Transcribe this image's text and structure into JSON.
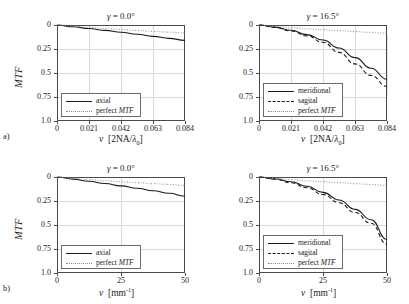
{
  "figure": {
    "panel_tags": [
      "a)",
      "b)"
    ],
    "ylabel": "MTF",
    "yticks": [
      "1.0",
      "0.75",
      "0.5",
      "0.25",
      "0"
    ],
    "xticks_top": [
      "0",
      "0.021",
      "0.042",
      "0.063",
      "0.084"
    ],
    "xticks_bottom": [
      "0",
      "25",
      "50"
    ],
    "xlabel_top_sym": "ν",
    "xlabel_top_unit_open": "[2NA/",
    "xlabel_top_unit_lambda": "λ",
    "xlabel_top_unit_sub": "0",
    "xlabel_top_unit_close": "]",
    "xlabel_bottom_sym": "ν",
    "xlabel_bottom_unit_open": "[mm",
    "xlabel_bottom_unit_sup": "-1",
    "xlabel_bottom_unit_close": "]",
    "title_gamma_sym": "γ",
    "title_axial": "= 0.0°",
    "title_tilt": "= 16.5°",
    "legend_axial": "axial",
    "legend_meridional": "meridional",
    "legend_sagital": "sagital",
    "legend_perfect_pre": "perfect ",
    "legend_perfect_mtf": "MTF",
    "colors": {
      "curve": "#1a1a1a",
      "perfect": "#9a9a9a",
      "grid": "#d8d8d8",
      "axis": "#4a4a4a"
    }
  },
  "chart_data": [
    {
      "type": "line",
      "panel": "a-left",
      "title": "γ = 0.0°",
      "xlabel": "ν [2NA/λ0]",
      "ylabel": "MTF",
      "xlim": [
        0,
        0.084
      ],
      "ylim": [
        0,
        1.0
      ],
      "xticks": [
        0,
        0.021,
        0.042,
        0.063,
        0.084
      ],
      "yticks": [
        0,
        0.25,
        0.5,
        0.75,
        1.0
      ],
      "grid": true,
      "legend_position": "lower-left",
      "series": [
        {
          "name": "axial",
          "style": "solid",
          "x": [
            0,
            0.0105,
            0.021,
            0.0315,
            0.042,
            0.0525,
            0.063,
            0.0735,
            0.084
          ],
          "y": [
            1.0,
            0.982,
            0.963,
            0.944,
            0.924,
            0.903,
            0.882,
            0.861,
            0.84
          ]
        },
        {
          "name": "perfect MTF",
          "style": "dotted",
          "x": [
            0,
            0.0105,
            0.021,
            0.0315,
            0.042,
            0.0525,
            0.063,
            0.0735,
            0.084
          ],
          "y": [
            1.0,
            0.987,
            0.975,
            0.964,
            0.953,
            0.944,
            0.934,
            0.925,
            0.917
          ]
        }
      ]
    },
    {
      "type": "line",
      "panel": "a-right",
      "title": "γ = 16.5°",
      "xlabel": "ν [2NA/λ0]",
      "ylabel": "MTF",
      "xlim": [
        0,
        0.084
      ],
      "ylim": [
        0,
        1.0
      ],
      "xticks": [
        0,
        0.021,
        0.042,
        0.063,
        0.084
      ],
      "yticks": [
        0,
        0.25,
        0.5,
        0.75,
        1.0
      ],
      "grid": true,
      "legend_position": "lower-left",
      "series": [
        {
          "name": "meridional",
          "style": "solid",
          "x": [
            0,
            0.0105,
            0.021,
            0.0315,
            0.042,
            0.0525,
            0.063,
            0.0735,
            0.084
          ],
          "y": [
            1.0,
            0.978,
            0.945,
            0.9,
            0.843,
            0.76,
            0.66,
            0.55,
            0.435
          ]
        },
        {
          "name": "sagital",
          "style": "dashed",
          "x": [
            0,
            0.0105,
            0.021,
            0.0315,
            0.042,
            0.0525,
            0.063,
            0.0735,
            0.084
          ],
          "y": [
            1.0,
            0.975,
            0.938,
            0.887,
            0.82,
            0.715,
            0.595,
            0.475,
            0.36
          ]
        },
        {
          "name": "perfect MTF",
          "style": "dotted",
          "x": [
            0,
            0.0105,
            0.021,
            0.0315,
            0.042,
            0.0525,
            0.063,
            0.0735,
            0.084
          ],
          "y": [
            1.0,
            0.985,
            0.972,
            0.961,
            0.951,
            0.941,
            0.932,
            0.923,
            0.915
          ]
        }
      ]
    },
    {
      "type": "line",
      "panel": "b-left",
      "title": "γ = 0.0°",
      "xlabel": "ν [mm-1]",
      "ylabel": "MTF",
      "xlim": [
        0,
        50
      ],
      "ylim": [
        0,
        1.0
      ],
      "xticks": [
        0,
        25,
        50
      ],
      "yticks": [
        0,
        0.25,
        0.5,
        0.75,
        1.0
      ],
      "grid": true,
      "legend_position": "lower-left",
      "series": [
        {
          "name": "axial",
          "style": "solid",
          "x": [
            0,
            6.25,
            12.5,
            18.75,
            25,
            31.25,
            37.5,
            43.75,
            50
          ],
          "y": [
            1.0,
            0.978,
            0.955,
            0.932,
            0.908,
            0.883,
            0.857,
            0.83,
            0.8
          ]
        },
        {
          "name": "perfect MTF",
          "style": "dotted",
          "x": [
            0,
            6.25,
            12.5,
            18.75,
            25,
            31.25,
            37.5,
            43.75,
            50
          ],
          "y": [
            1.0,
            0.985,
            0.972,
            0.961,
            0.951,
            0.941,
            0.931,
            0.922,
            0.913
          ]
        }
      ]
    },
    {
      "type": "line",
      "panel": "b-right",
      "title": "γ = 16.5°",
      "xlabel": "ν [mm-1]",
      "ylabel": "MTF",
      "xlim": [
        0,
        50
      ],
      "ylim": [
        0,
        1.0
      ],
      "xticks": [
        0,
        25,
        50
      ],
      "yticks": [
        0,
        0.25,
        0.5,
        0.75,
        1.0
      ],
      "grid": true,
      "legend_position": "lower-left",
      "series": [
        {
          "name": "meridional",
          "style": "solid",
          "x": [
            0,
            6.25,
            12.5,
            18.75,
            25,
            31.25,
            37.5,
            43.75,
            50
          ],
          "y": [
            1.0,
            0.982,
            0.95,
            0.903,
            0.84,
            0.76,
            0.663,
            0.555,
            0.348
          ]
        },
        {
          "name": "sagital",
          "style": "dashed",
          "x": [
            0,
            6.25,
            12.5,
            18.75,
            25,
            31.25,
            37.5,
            43.75,
            50
          ],
          "y": [
            1.0,
            0.978,
            0.94,
            0.888,
            0.818,
            0.732,
            0.63,
            0.518,
            0.3
          ]
        },
        {
          "name": "perfect MTF",
          "style": "dotted",
          "x": [
            0,
            6.25,
            12.5,
            18.75,
            25,
            31.25,
            37.5,
            43.75,
            50
          ],
          "y": [
            1.0,
            0.985,
            0.972,
            0.961,
            0.951,
            0.941,
            0.931,
            0.922,
            0.913
          ]
        }
      ]
    }
  ]
}
